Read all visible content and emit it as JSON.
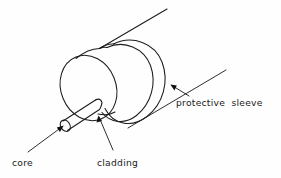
{
  "figure": {
    "background_color": "#fefefe",
    "ink_color": "#1b1b1b",
    "width": 281,
    "height": 178
  },
  "labels": {
    "core": "core",
    "cladding": "cladding",
    "protective_sleeve": "protective  sleeve"
  },
  "diagram_data": {
    "type": "technical-line-drawing",
    "subject": "optical fibre end showing concentric layers",
    "parts": [
      {
        "name": "core",
        "shape": "small cylinder rod protruding at lower-left",
        "label": "core",
        "label_position": "bottom-left",
        "leader": "diagonal line from label up-right to arrowhead at rod end face"
      },
      {
        "name": "cladding",
        "shape": "medium cylinder / disc surrounding the core",
        "label": "cladding",
        "label_position": "bottom-center",
        "leader": "near-vertical line from label up to arrowhead on cladding face"
      },
      {
        "name": "protective sleeve",
        "shape": "large outer cylinder enclosing the cladding",
        "label": "protective  sleeve",
        "label_position": "right",
        "leader": "diagonal line from label up-left to arrowhead on sleeve surface"
      }
    ],
    "layer_order_outward": [
      "core",
      "cladding",
      "protective sleeve"
    ],
    "view": "three-quarter perspective, axis running lower-left to upper-right",
    "grid": false,
    "legend": false
  }
}
